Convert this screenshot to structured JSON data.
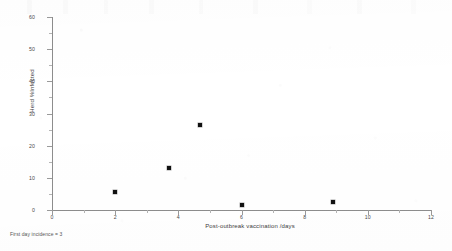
{
  "figure": {
    "note": "First day incidence = 3",
    "background_color": "#ffffff",
    "marker_color": "#111111",
    "axis_color": "#8d8d8d"
  },
  "chart_data": {
    "type": "scatter",
    "title": "",
    "subtitle": "",
    "xlabel": "Post-outbreak vaccination /days",
    "ylabel": "Herd %Infected",
    "xlim": [
      0,
      12
    ],
    "ylim": [
      0,
      60
    ],
    "grid": false,
    "legend": null,
    "xticks": [
      0,
      2,
      4,
      6,
      8,
      10,
      12
    ],
    "xtick_labels": [
      "0",
      "2",
      "4",
      "6",
      "8",
      "10",
      "12"
    ],
    "yticks": [
      0,
      10,
      20,
      30,
      40,
      50,
      60
    ],
    "ytick_labels": [
      "0",
      "10",
      "20",
      "30",
      "40",
      "50",
      "60"
    ],
    "x": [
      2.0,
      3.7,
      4.7,
      6.0,
      8.9
    ],
    "y": [
      5.6,
      13.0,
      26.5,
      1.6,
      2.5
    ],
    "points": [
      {
        "x": 2.0,
        "y": 5.6
      },
      {
        "x": 3.7,
        "y": 13.0
      },
      {
        "x": 4.7,
        "y": 26.5
      },
      {
        "x": 6.0,
        "y": 1.6
      },
      {
        "x": 8.9,
        "y": 2.5
      }
    ],
    "annotations": [
      "First day incidence = 3"
    ]
  }
}
